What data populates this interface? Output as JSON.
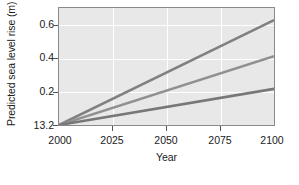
{
  "chart_data": {
    "type": "line",
    "title": "",
    "xlabel": "Year",
    "ylabel": "Predicted sea level rise (m)",
    "xlim": [
      2000,
      2100
    ],
    "ylim": [
      0.0,
      0.68
    ],
    "grid": true,
    "legend": "none",
    "xticks": [
      {
        "value": 2000,
        "label": "2000"
      },
      {
        "value": 2025,
        "label": "2025"
      },
      {
        "value": 2050,
        "label": "2050"
      },
      {
        "value": 2075,
        "label": "2075"
      },
      {
        "value": 2100,
        "label": "2100"
      }
    ],
    "yticks": [
      {
        "value": 0.6,
        "label": "0.6"
      },
      {
        "value": 0.4,
        "label": "0.4"
      },
      {
        "value": 0.2,
        "label": "0.2"
      },
      {
        "value": 0.0,
        "label": "13.2"
      }
    ],
    "x": [
      2000,
      2100
    ],
    "series": [
      {
        "name": "high-scenario",
        "color": "#808080",
        "values": [
          0.0,
          0.61
        ]
      },
      {
        "name": "mid-scenario",
        "color": "#909090",
        "values": [
          0.0,
          0.4
        ]
      },
      {
        "name": "low-scenario",
        "color": "#777777",
        "values": [
          0.0,
          0.21
        ]
      }
    ],
    "colors": {
      "plot_background": "#e8e8e8",
      "grid": "#ffffff",
      "frame": "#8a8a8a",
      "figure_background": "#ffffff",
      "text": "#1a1a1a"
    }
  }
}
